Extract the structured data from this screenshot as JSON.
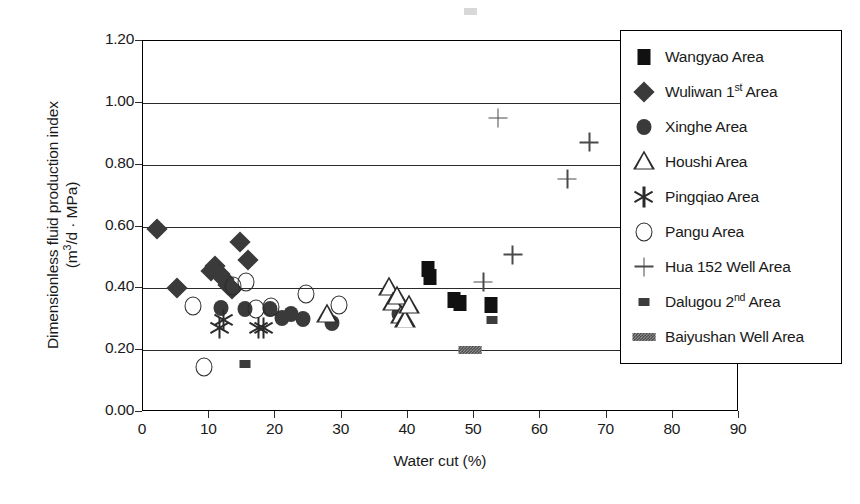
{
  "chart_data": {
    "type": "scatter",
    "title": "",
    "xlabel": "Water cut (%)",
    "ylabel_line1": "Dimensionless fluid production index",
    "ylabel_line2": "(m3/d · MPa)",
    "xlim": [
      0,
      90
    ],
    "ylim": [
      0.0,
      1.2
    ],
    "xticks": [
      0,
      10,
      20,
      30,
      40,
      50,
      60,
      70,
      80,
      90
    ],
    "xtick_labels": [
      "0",
      "10",
      "20",
      "30",
      "40",
      "50",
      "60",
      "70",
      "80",
      "90"
    ],
    "yticks": [
      0.0,
      0.2,
      0.4,
      0.6,
      0.8,
      1.0,
      1.2
    ],
    "ytick_labels": [
      "0.00",
      "0.20",
      "0.40",
      "0.60",
      "0.80",
      "1.00",
      "1.20"
    ],
    "grid": "horizontal",
    "legend_position": "right",
    "series": [
      {
        "name": "Wangyao Area",
        "marker": "filled-square",
        "points": [
          [
            43.0,
            0.462
          ],
          [
            43.4,
            0.437
          ],
          [
            46.9,
            0.363
          ],
          [
            47.8,
            0.352
          ],
          [
            52.6,
            0.345
          ]
        ]
      },
      {
        "name": "Wuliwan 1st Area",
        "marker": "filled-diamond",
        "points": [
          [
            2.1,
            0.592
          ],
          [
            5.2,
            0.401
          ],
          [
            10.2,
            0.455
          ],
          [
            10.9,
            0.472
          ],
          [
            11.6,
            0.447
          ],
          [
            12.2,
            0.43
          ],
          [
            12.8,
            0.412
          ],
          [
            13.4,
            0.398
          ],
          [
            14.6,
            0.551
          ],
          [
            15.8,
            0.491
          ]
        ]
      },
      {
        "name": "Xinghe Area",
        "marker": "filled-circle",
        "points": [
          [
            11.8,
            0.335
          ],
          [
            15.4,
            0.332
          ],
          [
            19.2,
            0.333
          ],
          [
            21.0,
            0.305
          ],
          [
            22.4,
            0.318
          ],
          [
            24.2,
            0.302
          ],
          [
            28.6,
            0.289
          ],
          [
            38.6,
            0.318
          ]
        ]
      },
      {
        "name": "Houshi Area",
        "marker": "open-triangle",
        "points": [
          [
            27.8,
            0.315
          ],
          [
            37.2,
            0.402
          ],
          [
            37.8,
            0.352
          ],
          [
            38.4,
            0.372
          ],
          [
            39.0,
            0.312
          ],
          [
            39.6,
            0.296
          ],
          [
            40.2,
            0.342
          ]
        ]
      },
      {
        "name": "Pingqiao Area",
        "marker": "asterisk",
        "points": [
          [
            11.6,
            0.272
          ],
          [
            12.2,
            0.296
          ],
          [
            17.4,
            0.271
          ],
          [
            18.2,
            0.273
          ]
        ]
      },
      {
        "name": "Pangu Area",
        "marker": "open-circle",
        "points": [
          [
            7.6,
            0.344
          ],
          [
            9.2,
            0.145
          ],
          [
            13.6,
            0.408
          ],
          [
            15.6,
            0.421
          ],
          [
            17.0,
            0.332
          ],
          [
            19.4,
            0.341
          ],
          [
            24.6,
            0.383
          ],
          [
            29.6,
            0.347
          ]
        ]
      },
      {
        "name": "Hua 152 Well Area",
        "marker": "plus",
        "points": [
          [
            53.6,
            0.951
          ],
          [
            67.4,
            0.872
          ],
          [
            64.1,
            0.754
          ],
          [
            55.8,
            0.509
          ],
          [
            51.4,
            0.42
          ]
        ]
      },
      {
        "name": "Dalugou 2nd Area",
        "marker": "small-filled-square",
        "points": [
          [
            15.4,
            0.155
          ],
          [
            52.7,
            0.296
          ]
        ]
      },
      {
        "name": "Baiyushan Well Area",
        "marker": "hatched-bar",
        "points": [
          [
            49.4,
            0.201
          ]
        ]
      }
    ]
  },
  "legend": {
    "items": [
      {
        "label": "Wangyao Area",
        "marker": "filled-square"
      },
      {
        "label": "Wuliwan 1",
        "suffix": "st",
        "label_tail": " Area",
        "marker": "filled-diamond"
      },
      {
        "label": "Xinghe Area",
        "marker": "filled-circle"
      },
      {
        "label": "Houshi Area",
        "marker": "open-triangle"
      },
      {
        "label": "Pingqiao Area",
        "marker": "asterisk"
      },
      {
        "label": "Pangu Area",
        "marker": "open-circle"
      },
      {
        "label": "Hua 152 Well Area",
        "marker": "plus"
      },
      {
        "label": "Dalugou 2",
        "suffix": "nd",
        "label_tail": " Area",
        "marker": "small-filled-square"
      },
      {
        "label": "Baiyushan Well Area",
        "marker": "hatched-bar"
      }
    ]
  }
}
